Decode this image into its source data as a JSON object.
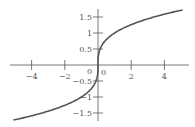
{
  "chart_data": {
    "type": "line",
    "title": "",
    "xlabel": "",
    "ylabel": "",
    "function": "y = x^(1/3)",
    "xlim": [
      -5.3,
      5.4
    ],
    "ylim": [
      -1.75,
      1.75
    ],
    "grid": false,
    "legend": null,
    "x_ticks": [
      -4,
      -2,
      2,
      4
    ],
    "x_tick_labels": [
      "−4",
      "−2",
      "2",
      "4"
    ],
    "y_ticks": [
      -1.5,
      -1,
      -0.5,
      0.5,
      1,
      1.5
    ],
    "y_tick_labels": [
      "−1.5",
      "−1",
      "−0.5",
      "0.5",
      "1",
      "1.5"
    ],
    "origin_labels": [
      "0",
      "0"
    ],
    "series": [
      {
        "name": "cube root",
        "x": [
          -5.1,
          -4,
          -3,
          -2,
          -1,
          -0.5,
          -0.2,
          -0.05,
          0,
          0.05,
          0.2,
          0.5,
          1,
          2,
          3,
          4,
          5.1
        ],
        "y": [
          -1.72,
          -1.59,
          -1.44,
          -1.26,
          -1.0,
          -0.79,
          -0.58,
          -0.37,
          0,
          0.37,
          0.58,
          0.79,
          1.0,
          1.26,
          1.44,
          1.59,
          1.72
        ]
      }
    ],
    "colors": {
      "curve": "#555555",
      "axes": "#555555"
    }
  }
}
